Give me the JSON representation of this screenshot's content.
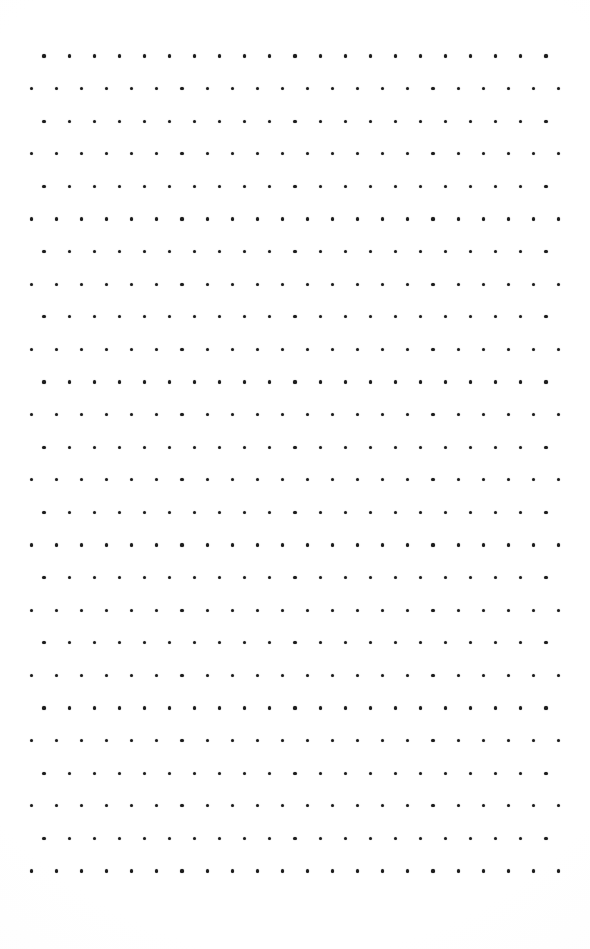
{
  "document": {
    "kind": "dot-grid-paper",
    "title": "Dot Grid Paper",
    "page_width": 590,
    "page_height": 949,
    "background_color": "#fefefe",
    "description": "Blank bullet-journal style dot grid page with staggered rows, no text content"
  },
  "grid": {
    "dot_color": "#1b1b1b",
    "dot_diameter_px": 3.2,
    "column_pitch_px": 25.1,
    "row_pitch_px": 32.6,
    "row_count": 26,
    "odd_row": {
      "label": "indented-row",
      "start_x_px": 44,
      "dot_count": 21,
      "end_x_px": 546
    },
    "even_row": {
      "label": "outdented-row",
      "start_x_px": 31.4,
      "dot_count": 22,
      "end_x_px": 558.5
    },
    "first_row_y_px": 56,
    "last_row_y_px": 871,
    "margin_top_px": 56,
    "margin_left_px": 31,
    "margin_right_px": 31,
    "margin_bottom_px": 78
  }
}
